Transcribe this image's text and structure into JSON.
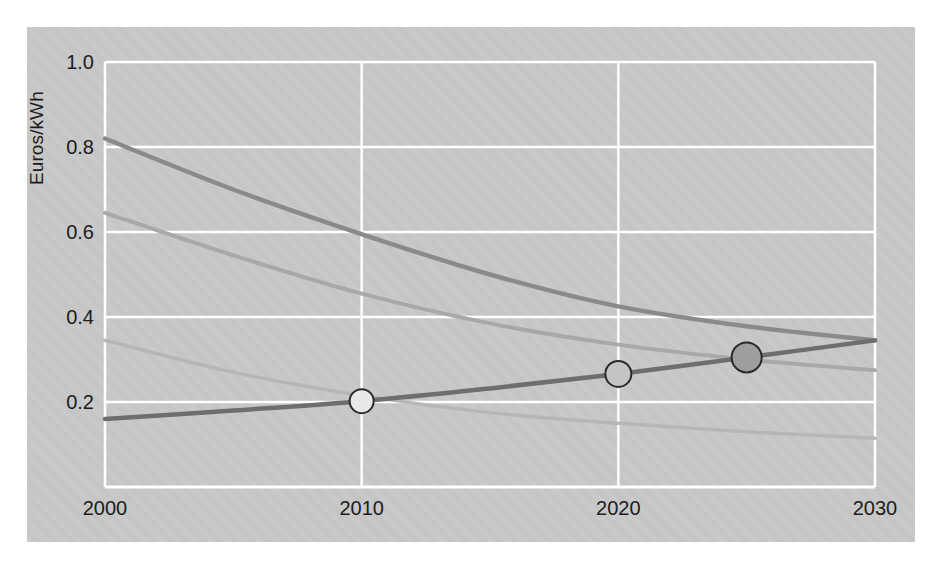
{
  "figure": {
    "background_color": "#c9c9c9",
    "page_background": "#ffffff",
    "gridline_color": "#ffffff",
    "text_color": "#1c1c1c"
  },
  "chart_data": {
    "type": "line",
    "title": "",
    "xlabel": "",
    "ylabel": "Euros/kWh",
    "xlim": [
      2000,
      2030
    ],
    "ylim": [
      0.0,
      1.0
    ],
    "xticks": [
      2000,
      2010,
      2020,
      2030
    ],
    "xticklabels": [
      "2000",
      "2010",
      "2020",
      "2030"
    ],
    "yticks": [
      0.2,
      0.4,
      0.6,
      0.8,
      1.0
    ],
    "yticklabels": [
      "0.2",
      "0.4",
      "0.6",
      "0.8",
      "1.0"
    ],
    "grid": true,
    "grid_axis": "both",
    "legend": false,
    "legend_position": "none",
    "series": [
      {
        "name": "declining-cost-curve-dark",
        "color": "#8a8a8a",
        "linewidth": 4.5,
        "x": [
          2000,
          2005,
          2010,
          2015,
          2020,
          2025,
          2030
        ],
        "values": [
          0.82,
          0.7,
          0.595,
          0.5,
          0.425,
          0.378,
          0.345
        ]
      },
      {
        "name": "declining-cost-curve-medium",
        "color": "#a8a8a8",
        "linewidth": 4.0,
        "x": [
          2000,
          2005,
          2010,
          2015,
          2020,
          2025,
          2030
        ],
        "values": [
          0.645,
          0.545,
          0.455,
          0.385,
          0.335,
          0.3,
          0.275
        ]
      },
      {
        "name": "declining-cost-curve-light",
        "color": "#b6b6b6",
        "linewidth": 3.5,
        "x": [
          2000,
          2005,
          2010,
          2015,
          2020,
          2025,
          2030
        ],
        "values": [
          0.345,
          0.27,
          0.215,
          0.175,
          0.15,
          0.13,
          0.115
        ]
      },
      {
        "name": "rising-grid-price-line",
        "color": "#6e6e6e",
        "linewidth": 4.5,
        "x": [
          2000,
          2005,
          2010,
          2015,
          2020,
          2025,
          2030
        ],
        "values": [
          0.16,
          0.18,
          0.202,
          0.232,
          0.266,
          0.305,
          0.345
        ]
      }
    ],
    "markers": [
      {
        "name": "grid-parity-marker-2010",
        "x": 2010,
        "y": 0.202,
        "fill": "#e8e8e8",
        "edge": "#2a2a2a",
        "radius": 12
      },
      {
        "name": "grid-parity-marker-2020",
        "x": 2020,
        "y": 0.266,
        "fill": "#c4c4c4",
        "edge": "#2a2a2a",
        "radius": 13
      },
      {
        "name": "grid-parity-marker-2025",
        "x": 2025,
        "y": 0.305,
        "fill": "#9e9e9e",
        "edge": "#2a2a2a",
        "radius": 15
      }
    ]
  }
}
